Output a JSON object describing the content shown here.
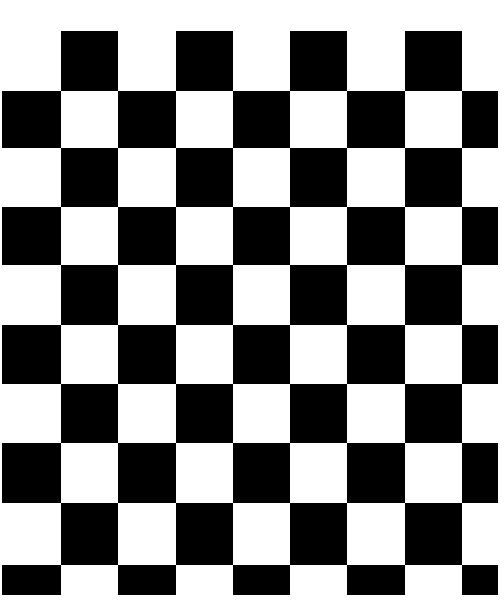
{
  "image": {
    "description": "Black and white checkerboard pattern",
    "background": "#ffffff",
    "dark_color": "#000000",
    "light_color": "#ffffff"
  },
  "board": {
    "columns": 9,
    "rows": 10,
    "col_edges": [
      2,
      61,
      118,
      176,
      233,
      290,
      347,
      405,
      462,
      498
    ],
    "row_edges": [
      31,
      91,
      148,
      207,
      265,
      325,
      384,
      443,
      503,
      565,
      595
    ],
    "first_row_black_parity": 1
  }
}
